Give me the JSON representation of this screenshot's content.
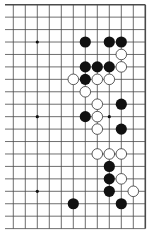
{
  "board": {
    "description": "Go board fragment (right side of 19x19 board)",
    "columns_shown": 12,
    "rows_shown": 19,
    "geometry": {
      "x0": 13.3,
      "dx": 12.0,
      "y0": 4.7,
      "dy": 12.44,
      "left_extend": 5
    },
    "colors": {
      "line": "#4a4a4a",
      "black": "#111111",
      "white": "#ffffff",
      "white_outline": "#333333",
      "background": "#ffffff"
    },
    "star_points": [
      [
        2,
        3
      ],
      [
        2,
        9
      ],
      [
        2,
        15
      ],
      [
        8,
        3
      ],
      [
        8,
        9
      ],
      [
        8,
        15
      ]
    ],
    "black_stones": [
      [
        6,
        3
      ],
      [
        8,
        3
      ],
      [
        9,
        3
      ],
      [
        6,
        5
      ],
      [
        7,
        5
      ],
      [
        8,
        5
      ],
      [
        6,
        6
      ],
      [
        9,
        8
      ],
      [
        6,
        9
      ],
      [
        9,
        10
      ],
      [
        8,
        13
      ],
      [
        8,
        14
      ],
      [
        8,
        15
      ],
      [
        5,
        16
      ],
      [
        9,
        16
      ]
    ],
    "white_stones": [
      [
        9,
        4
      ],
      [
        9,
        5
      ],
      [
        5,
        6
      ],
      [
        7,
        6
      ],
      [
        8,
        6
      ],
      [
        6,
        7
      ],
      [
        7,
        8
      ],
      [
        7,
        9
      ],
      [
        7,
        10
      ],
      [
        7,
        12
      ],
      [
        8,
        12
      ],
      [
        9,
        12
      ],
      [
        9,
        14
      ],
      [
        10,
        15
      ]
    ]
  }
}
